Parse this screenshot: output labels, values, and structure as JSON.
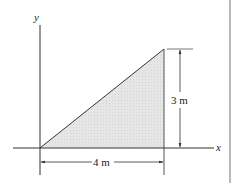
{
  "figure": {
    "axes": {
      "x_label": "x",
      "y_label": "y"
    },
    "shape": {
      "type": "right-triangle",
      "vertices": [
        [
          0,
          0
        ],
        [
          4,
          0
        ],
        [
          4,
          3
        ]
      ],
      "fill_color": "#e4e4e4",
      "stroke_color": "#333333"
    },
    "dimensions": {
      "base_label": "4 m",
      "height_label": "3 m"
    },
    "colors": {
      "line": "#333333",
      "border": "#a0a0a0",
      "background": "#ffffff"
    }
  }
}
